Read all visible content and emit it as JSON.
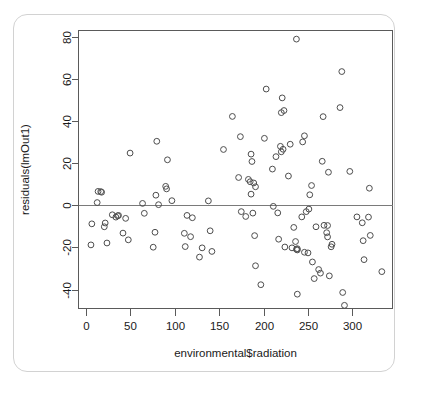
{
  "chart_data": {
    "type": "scatter",
    "title": "",
    "xlabel": "environmental$radiation",
    "ylabel": "residuals(lmOut1)",
    "xlim": [
      -8,
      345
    ],
    "ylim": [
      -49,
      83
    ],
    "xticks": [
      0,
      50,
      100,
      150,
      200,
      250,
      300
    ],
    "yticks": [
      -40,
      -20,
      0,
      20,
      40,
      60,
      80
    ],
    "grid": false,
    "legend": null,
    "reference_lines": [
      {
        "orientation": "horizontal",
        "y": 0
      }
    ],
    "marker": "open-circle",
    "marker_color": "#4d4d4d",
    "points": [
      {
        "x": 7,
        "y": -8.8
      },
      {
        "x": 6,
        "y": -18.8
      },
      {
        "x": 13,
        "y": 1.3
      },
      {
        "x": 14,
        "y": 6.6
      },
      {
        "x": 17,
        "y": 6.5
      },
      {
        "x": 18,
        "y": 6.2
      },
      {
        "x": 21,
        "y": -10.2
      },
      {
        "x": 22,
        "y": -8.4
      },
      {
        "x": 24,
        "y": -17.9
      },
      {
        "x": 30,
        "y": -4.5
      },
      {
        "x": 34,
        "y": -5.6
      },
      {
        "x": 36,
        "y": -5.0
      },
      {
        "x": 37,
        "y": -4.8
      },
      {
        "x": 42,
        "y": -13.2
      },
      {
        "x": 45,
        "y": -6.2
      },
      {
        "x": 48,
        "y": -16.4
      },
      {
        "x": 50,
        "y": 24.8
      },
      {
        "x": 64,
        "y": 0.9
      },
      {
        "x": 66,
        "y": -3.8
      },
      {
        "x": 76,
        "y": -19.9
      },
      {
        "x": 78,
        "y": -12.8
      },
      {
        "x": 79,
        "y": 4.8
      },
      {
        "x": 80,
        "y": 30.4
      },
      {
        "x": 82,
        "y": 0.3
      },
      {
        "x": 90,
        "y": 9.0
      },
      {
        "x": 91,
        "y": 7.8
      },
      {
        "x": 92,
        "y": 21.6
      },
      {
        "x": 97,
        "y": 2.2
      },
      {
        "x": 111,
        "y": -13.3
      },
      {
        "x": 112,
        "y": -19.6
      },
      {
        "x": 114,
        "y": -4.8
      },
      {
        "x": 118,
        "y": -14.9
      },
      {
        "x": 120,
        "y": -5.9
      },
      {
        "x": 128,
        "y": -24.6
      },
      {
        "x": 131,
        "y": -20.2
      },
      {
        "x": 138,
        "y": 2.1
      },
      {
        "x": 140,
        "y": -12.1
      },
      {
        "x": 142,
        "y": -21.9
      },
      {
        "x": 155,
        "y": 26.5
      },
      {
        "x": 165,
        "y": 42.2
      },
      {
        "x": 172,
        "y": 13.2
      },
      {
        "x": 174,
        "y": 32.6
      },
      {
        "x": 175,
        "y": -3.0
      },
      {
        "x": 180,
        "y": -5.3
      },
      {
        "x": 183,
        "y": 12.3
      },
      {
        "x": 185,
        "y": 11.2
      },
      {
        "x": 186,
        "y": 24.3
      },
      {
        "x": 186,
        "y": 5.3
      },
      {
        "x": 187,
        "y": 20.8
      },
      {
        "x": 188,
        "y": -3.7
      },
      {
        "x": 189,
        "y": 10.6
      },
      {
        "x": 190,
        "y": -14.4
      },
      {
        "x": 191,
        "y": 8.8
      },
      {
        "x": 191,
        "y": -28.7
      },
      {
        "x": 197,
        "y": -37.7
      },
      {
        "x": 201,
        "y": 31.8
      },
      {
        "x": 203,
        "y": 55.2
      },
      {
        "x": 210,
        "y": 17.2
      },
      {
        "x": 211,
        "y": -0.5
      },
      {
        "x": 214,
        "y": 23.1
      },
      {
        "x": 216,
        "y": -3.6
      },
      {
        "x": 217,
        "y": -16.1
      },
      {
        "x": 219,
        "y": 28.0
      },
      {
        "x": 220,
        "y": 44.0
      },
      {
        "x": 220,
        "y": 25.4
      },
      {
        "x": 221,
        "y": 51.0
      },
      {
        "x": 222,
        "y": 26.6
      },
      {
        "x": 223,
        "y": 45.0
      },
      {
        "x": 224,
        "y": -19.8
      },
      {
        "x": 228,
        "y": 13.9
      },
      {
        "x": 230,
        "y": 29.0
      },
      {
        "x": 232,
        "y": -20.2
      },
      {
        "x": 234,
        "y": -10.5
      },
      {
        "x": 236,
        "y": -17.2
      },
      {
        "x": 237,
        "y": 78.9
      },
      {
        "x": 237,
        "y": -20.9
      },
      {
        "x": 238,
        "y": -20.6
      },
      {
        "x": 238,
        "y": -21.2
      },
      {
        "x": 238,
        "y": -42.2
      },
      {
        "x": 243,
        "y": -5.5
      },
      {
        "x": 244,
        "y": 30.1
      },
      {
        "x": 246,
        "y": 33.0
      },
      {
        "x": 246,
        "y": -22.3
      },
      {
        "x": 248,
        "y": -3.0
      },
      {
        "x": 250,
        "y": -22.6
      },
      {
        "x": 251,
        "y": -1.8
      },
      {
        "x": 252,
        "y": 5.0
      },
      {
        "x": 254,
        "y": 9.4
      },
      {
        "x": 255,
        "y": -26.9
      },
      {
        "x": 257,
        "y": -34.8
      },
      {
        "x": 259,
        "y": -10.2
      },
      {
        "x": 262,
        "y": -30.5
      },
      {
        "x": 264,
        "y": -32.2
      },
      {
        "x": 266,
        "y": 20.9
      },
      {
        "x": 267,
        "y": 42.1
      },
      {
        "x": 268,
        "y": -9.5
      },
      {
        "x": 271,
        "y": -13.0
      },
      {
        "x": 272,
        "y": -15.0
      },
      {
        "x": 272,
        "y": -9.6
      },
      {
        "x": 273,
        "y": 15.7
      },
      {
        "x": 274,
        "y": -33.5
      },
      {
        "x": 276,
        "y": -19.7
      },
      {
        "x": 277,
        "y": -18.5
      },
      {
        "x": 286,
        "y": 46.4
      },
      {
        "x": 288,
        "y": 63.5
      },
      {
        "x": 289,
        "y": -41.4
      },
      {
        "x": 291,
        "y": -47.5
      },
      {
        "x": 297,
        "y": 16.1
      },
      {
        "x": 305,
        "y": -5.5
      },
      {
        "x": 311,
        "y": -8.3
      },
      {
        "x": 312,
        "y": -16.8
      },
      {
        "x": 313,
        "y": -25.8
      },
      {
        "x": 318,
        "y": -5.6
      },
      {
        "x": 319,
        "y": 8.1
      },
      {
        "x": 320,
        "y": -14.3
      },
      {
        "x": 333,
        "y": -31.5
      }
    ]
  }
}
